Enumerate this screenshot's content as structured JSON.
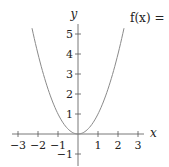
{
  "chart_data": {
    "type": "line",
    "title": "",
    "annotation": "f(x) = :",
    "xlabel": "x",
    "ylabel": "y",
    "xlim": [
      -3.3,
      3.3
    ],
    "ylim": [
      -1.3,
      5.5
    ],
    "x_ticks": [
      -3,
      -2,
      -1,
      1,
      2,
      3
    ],
    "x_tick_labels": [
      "−3",
      "−2",
      "−1",
      "1",
      "2",
      "3"
    ],
    "y_ticks": [
      -1,
      1,
      2,
      3,
      4,
      5
    ],
    "y_tick_labels": [
      "−1",
      "1",
      "2",
      "3",
      "4",
      "5"
    ],
    "grid": false,
    "legend": null,
    "series": [
      {
        "name": "f(x) = x^2",
        "color": "#8a8a8a",
        "x": [
          -2.3,
          -2.0,
          -1.5,
          -1.0,
          -0.5,
          0.0,
          0.5,
          1.0,
          1.5,
          2.0,
          2.3
        ],
        "y": [
          5.29,
          4.0,
          2.25,
          1.0,
          0.25,
          0.0,
          0.25,
          1.0,
          2.25,
          4.0,
          5.29
        ]
      }
    ]
  },
  "layout": {
    "origin_px": [
      78,
      134
    ],
    "unit_px": 20
  }
}
